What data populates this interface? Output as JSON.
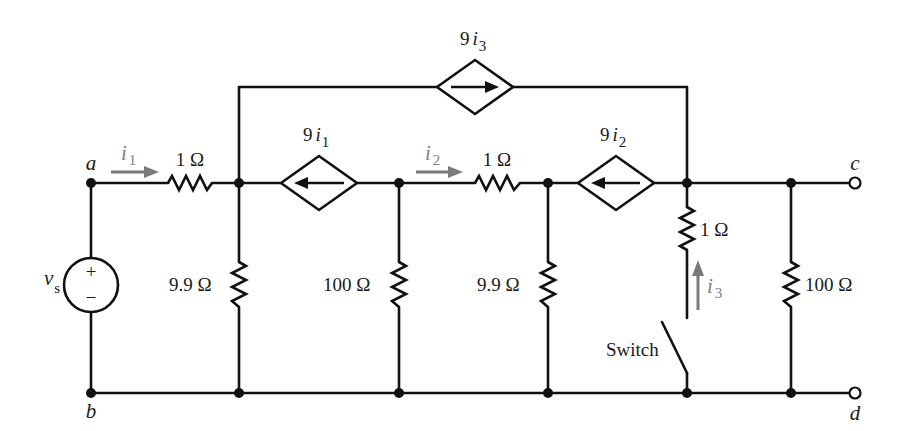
{
  "diagram": {
    "type": "circuit-schematic",
    "nodes": {
      "a": "a",
      "b": "b",
      "c": "c",
      "d": "d"
    },
    "source": {
      "label": "v",
      "subscript": "s",
      "plus": "+",
      "minus": "−"
    },
    "currents": {
      "i1": {
        "base": "i",
        "sub": "1"
      },
      "i2": {
        "base": "i",
        "sub": "2"
      },
      "i3": {
        "base": "i",
        "sub": "3"
      }
    },
    "dependent_sources": {
      "top": {
        "coef": "9",
        "base": "i",
        "sub": "3",
        "direction": "right"
      },
      "left": {
        "coef": "9",
        "base": "i",
        "sub": "1",
        "direction": "left"
      },
      "right": {
        "coef": "9",
        "base": "i",
        "sub": "2",
        "direction": "left"
      }
    },
    "resistors": {
      "r_series_1": "1 Ω",
      "r_shunt_1": "9.9 Ω",
      "r_shunt_2": "100 Ω",
      "r_series_2": "1 Ω",
      "r_shunt_3": "9.9 Ω",
      "r_switch_branch": "1 Ω",
      "r_load": "100 Ω"
    },
    "switch": {
      "label": "Switch"
    },
    "colors": {
      "wire": "#111111",
      "current_arrow": "#7a7a7a",
      "background": "#ffffff"
    }
  }
}
